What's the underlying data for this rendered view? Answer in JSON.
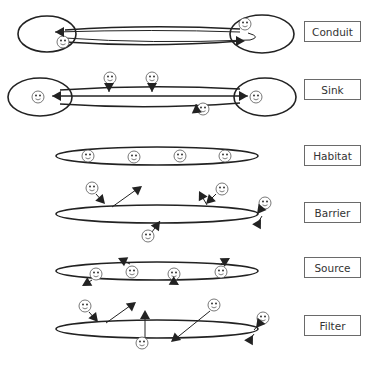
{
  "colors": {
    "stroke": "#222222",
    "face_stroke": "#555555",
    "label_border": "#6a6a6a",
    "label_text": "#333333",
    "background": "#ffffff"
  },
  "labels": [
    {
      "id": "conduit",
      "text": "Conduit",
      "y": 21
    },
    {
      "id": "sink",
      "text": "Sink",
      "y": 79
    },
    {
      "id": "habitat",
      "text": "Habitat",
      "y": 145
    },
    {
      "id": "barrier",
      "text": "Barrier",
      "y": 202
    },
    {
      "id": "source",
      "text": "Source",
      "y": 257
    },
    {
      "id": "filter",
      "text": "Filter",
      "y": 315
    }
  ],
  "diagrams": {
    "conduit": {
      "ellipses": [
        {
          "cx": 47,
          "cy": 34,
          "rx": 29,
          "ry": 18
        },
        {
          "cx": 262,
          "cy": 34,
          "rx": 32,
          "ry": 19
        }
      ],
      "corridor": [
        {
          "d": "M 65 30 Q 150 24 240 29"
        },
        {
          "d": "M 65 42 Q 150 48 240 41"
        }
      ],
      "faces": [
        {
          "x": 63,
          "y": 42
        },
        {
          "x": 245,
          "y": 24
        }
      ],
      "arrows": [
        {
          "d": "M 240 32 Q 155 29 55 32",
          "head": [
            55,
            32,
            180
          ]
        },
        {
          "d": "M 65 38 Q 150 44 250 40 Q 262 37 248 33",
          "head": [
            245,
            41,
            0
          ]
        }
      ]
    },
    "sink": {
      "ellipses": [
        {
          "cx": 40,
          "cy": 97,
          "rx": 32,
          "ry": 19
        },
        {
          "cx": 265,
          "cy": 97,
          "rx": 31,
          "ry": 19
        }
      ],
      "corridor": [
        {
          "d": "M 60 90 Q 150 84 240 89"
        },
        {
          "d": "M 60 104 Q 150 110 240 103"
        }
      ],
      "faces": [
        {
          "x": 38,
          "y": 97
        },
        {
          "x": 110,
          "y": 78
        },
        {
          "x": 152,
          "y": 78
        },
        {
          "x": 256,
          "y": 97
        },
        {
          "x": 203,
          "y": 109
        }
      ],
      "arrows": [
        {
          "d": "M 240 96 L 52 96",
          "head": [
            52,
            96,
            180
          ]
        },
        {
          "d": "M 60 96 L 248 96",
          "head": [
            248,
            96,
            0
          ]
        },
        {
          "d": "M 109 84 L 109 92",
          "head": [
            109,
            92,
            90
          ]
        },
        {
          "d": "M 152 84 L 152 92",
          "head": [
            152,
            92,
            90
          ]
        },
        {
          "d": "M 198 112 L 196 104",
          "head": [
            196,
            104,
            -95
          ]
        }
      ]
    },
    "habitat": {
      "ellipses": [
        {
          "cx": 157,
          "cy": 156,
          "rx": 101,
          "ry": 9
        }
      ],
      "faces": [
        {
          "x": 88,
          "y": 156
        },
        {
          "x": 134,
          "y": 157
        },
        {
          "x": 180,
          "y": 156
        },
        {
          "x": 225,
          "y": 156
        }
      ]
    },
    "barrier": {
      "ellipses": [
        {
          "cx": 157,
          "cy": 214,
          "rx": 101,
          "ry": 9
        }
      ],
      "faces": [
        {
          "x": 92,
          "y": 188
        },
        {
          "x": 222,
          "y": 189
        },
        {
          "x": 265,
          "y": 203
        },
        {
          "x": 148,
          "y": 236
        }
      ],
      "arrows": [
        {
          "d": "M 96 194 L 104 203",
          "head": [
            105,
            204,
            48
          ]
        },
        {
          "d": "M 112 207 L 140 187",
          "head": [
            142,
            186,
            -38
          ]
        },
        {
          "d": "M 216 194 L 207 203",
          "head": [
            206,
            204,
            135
          ]
        },
        {
          "d": "M 207 205 L 200 193",
          "head": [
            199,
            191,
            -118
          ]
        },
        {
          "d": "M 262 208 L 256 216",
          "head": [
            257,
            214,
            128
          ]
        },
        {
          "d": "M 256 226 L 262 216",
          "head": [
            261,
            219,
            -60
          ]
        },
        {
          "d": "M 152 232 L 160 221",
          "head": [
            160,
            221,
            -55
          ]
        }
      ]
    },
    "source": {
      "ellipses": [
        {
          "cx": 157,
          "cy": 271,
          "rx": 101,
          "ry": 9
        }
      ],
      "faces": [
        {
          "x": 96,
          "y": 274
        },
        {
          "x": 132,
          "y": 272
        },
        {
          "x": 174,
          "y": 274
        },
        {
          "x": 221,
          "y": 272
        }
      ],
      "arrows": [
        {
          "d": "M 130 264 L 120 259",
          "head": [
            118,
            258,
            -155
          ]
        },
        {
          "d": "M 92 280 L 84 285",
          "head": [
            82,
            286,
            150
          ]
        },
        {
          "d": "M 172 281 L 178 284",
          "head": [
            179,
            285,
            30
          ]
        },
        {
          "d": "M 221 264 L 229 259",
          "head": [
            230,
            258,
            -30
          ]
        }
      ]
    },
    "filter": {
      "ellipses": [
        {
          "cx": 157,
          "cy": 329,
          "rx": 101,
          "ry": 9
        }
      ],
      "faces": [
        {
          "x": 85,
          "y": 306
        },
        {
          "x": 142,
          "y": 343
        },
        {
          "x": 214,
          "y": 305
        },
        {
          "x": 263,
          "y": 318
        }
      ],
      "arrows": [
        {
          "d": "M 89 312 L 96 320",
          "head": [
            98,
            322,
            50
          ]
        },
        {
          "d": "M 106 323 L 134 303",
          "head": [
            136,
            302,
            -38
          ]
        },
        {
          "d": "M 145 337 L 145 312",
          "head": [
            145,
            310,
            -90
          ]
        },
        {
          "d": "M 210 311 L 174 340",
          "head": [
            171,
            342,
            140
          ]
        },
        {
          "d": "M 260 323 L 254 330",
          "head": [
            256,
            328,
            128
          ]
        },
        {
          "d": "M 249 341 L 254 334",
          "head": [
            253,
            335,
            -60
          ]
        }
      ]
    }
  }
}
